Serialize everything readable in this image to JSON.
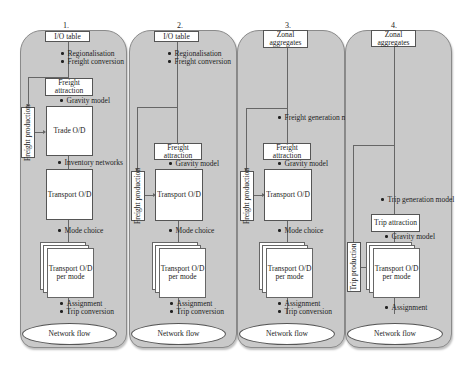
{
  "diagram": {
    "panels": [
      {
        "number": "1.",
        "source": "I/O table",
        "notes_top": [
          "Regionalisation",
          "Freight conversion"
        ],
        "attraction": "Freight attraction",
        "gravity": "Gravity model",
        "production": "Freight production",
        "trade_od": "Trade O/D",
        "inventory": "Inventory networks",
        "transport_od": "Transport O/D",
        "mode_choice": "Mode choice",
        "per_mode": "Transport O/D per mode",
        "notes_bottom": [
          "Assignment",
          "Trip conversion"
        ],
        "output": "Network flow"
      },
      {
        "number": "2.",
        "source": "I/O table",
        "notes_top": [
          "Regionalisation",
          "Freight conversion"
        ],
        "attraction": "Freight attraction",
        "gravity": "Gravity model",
        "production": "Freight production",
        "transport_od": "Transport O/D",
        "mode_choice": "Mode choice",
        "per_mode": "Transport O/D per mode",
        "notes_bottom": [
          "Assignment",
          "Trip conversion"
        ],
        "output": "Network flow"
      },
      {
        "number": "3.",
        "source": "Zonal aggregates",
        "generation": "Freight generation model",
        "attraction": "Freight attraction",
        "gravity": "Gravity model",
        "production": "Freight production",
        "transport_od": "Transport O/D",
        "mode_choice": "Mode choice",
        "per_mode": "Transport O/D per mode",
        "notes_bottom": [
          "Assignment",
          "Trip conversion"
        ],
        "output": "Network flow"
      },
      {
        "number": "4.",
        "source": "Zonal aggregates",
        "generation": "Trip generation model",
        "attraction": "Trip attraction",
        "gravity": "Gravity model",
        "production": "Trip production",
        "per_mode": "Transport O/D per mode",
        "notes_bottom": [
          "Assignment"
        ],
        "output": "Network flow"
      }
    ]
  }
}
